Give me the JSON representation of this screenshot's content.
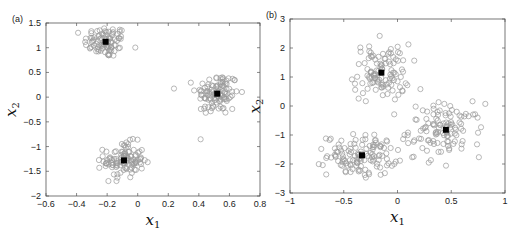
{
  "chart_data": [
    {
      "panel": "(a)",
      "type": "scatter",
      "xlabel": "x1",
      "ylabel": "x2",
      "xlim": [
        -0.6,
        0.8
      ],
      "ylim": [
        -2,
        1.5
      ],
      "xticks": [
        "-0.6",
        "-0.4",
        "-0.2",
        "0",
        "0.2",
        "0.4",
        "0.6",
        "0.8"
      ],
      "yticks": [
        "-2",
        "-1.5",
        "-1",
        "-0.5",
        "0",
        "0.5",
        "1",
        "1.5"
      ],
      "grid": false,
      "series": [
        {
          "name": "data points",
          "marker": "open-circle",
          "color": "#9a9a9a",
          "clusters": [
            {
              "center": [
                -0.21,
                1.12
              ],
              "spread": [
                0.07,
                0.16
              ],
              "n": 90
            },
            {
              "center": [
                0.52,
                0.07
              ],
              "spread": [
                0.07,
                0.22
              ],
              "n": 110
            },
            {
              "center": [
                -0.09,
                -1.28
              ],
              "spread": [
                0.065,
                0.18
              ],
              "n": 110
            }
          ]
        },
        {
          "name": "centroids",
          "marker": "filled-square",
          "color": "#000000",
          "points": [
            [
              -0.21,
              1.12
            ],
            [
              0.52,
              0.07
            ],
            [
              -0.09,
              -1.28
            ]
          ]
        }
      ]
    },
    {
      "panel": "(b)",
      "type": "scatter",
      "xlabel": "x1",
      "ylabel": "x2",
      "xlim": [
        -1,
        1
      ],
      "ylim": [
        -3,
        3
      ],
      "xticks": [
        "-1",
        "-0.5",
        "0",
        "0.5",
        "1"
      ],
      "yticks": [
        "-3",
        "-2",
        "-1",
        "0",
        "1",
        "2",
        "3"
      ],
      "grid": false,
      "series": [
        {
          "name": "data points",
          "marker": "open-circle",
          "color": "#9a9a9a",
          "clusters": [
            {
              "center": [
                -0.15,
                1.15
              ],
              "spread": [
                0.13,
                0.5
              ],
              "n": 110
            },
            {
              "center": [
                0.45,
                -0.82
              ],
              "spread": [
                0.17,
                0.45
              ],
              "n": 110
            },
            {
              "center": [
                -0.33,
                -1.7
              ],
              "spread": [
                0.16,
                0.35
              ],
              "n": 130
            }
          ]
        },
        {
          "name": "centroids",
          "marker": "filled-square",
          "color": "#000000",
          "points": [
            [
              -0.15,
              1.15
            ],
            [
              0.45,
              -0.82
            ],
            [
              -0.33,
              -1.7
            ]
          ]
        }
      ]
    }
  ],
  "panels": [
    {
      "label": "(a)"
    },
    {
      "label": "(b)"
    }
  ],
  "colors": {
    "points": "#9a9a9a",
    "centroid": "#000000",
    "axis": "#555555"
  }
}
